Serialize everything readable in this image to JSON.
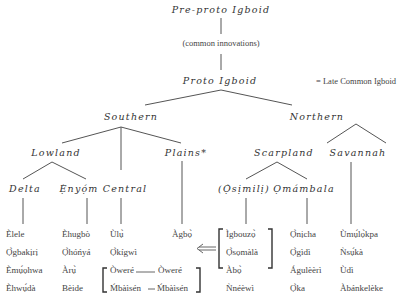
{
  "title_node": "Pre-proto Igboid",
  "innovation_note": "(common innovations)",
  "proto_node": "Proto Igboid",
  "proto_gloss": "= Late Common Igboid",
  "branches": {
    "southern": "Southern",
    "northern": "Northern",
    "lowland": "Lowland",
    "plains": "Plains*",
    "scarpland": "Scarpland",
    "savannah": "Savannah",
    "delta": "Delta",
    "enyom": "Ẹ̀nyọ́m",
    "central": "Central",
    "osimili": "(Ọ̀sịmilị)",
    "omambala": "Ọmámbala"
  },
  "leaves": {
    "delta": [
      "Èlele",
      "Ọ̀gbakịrị",
      "Èmụ́ọhwa",
      "Èhwụ́dà"
    ],
    "enyom": [
      "Èhugbò",
      "Ọ̀hóńyá",
      "Àrụ̀",
      "Bèide"
    ],
    "central": [
      "Ùlụ̀",
      "Ọ̀kígwì"
    ],
    "central_bracket": [
      [
        "Òweré",
        "Òweré"
      ],
      [
        "Ḿbàìsén",
        "Ḿbàìsén"
      ]
    ],
    "plains": [
      "Àgbọ̀"
    ],
    "osimili": [
      "Ìgbouzọ̀",
      "Ọ̀sọmàlà",
      "Àbọ̀",
      "Ǹnéèwì"
    ],
    "omambala": [
      "Ọ̀nịcha",
      "Ọ̀gìdì",
      "Águlèèrì",
      "Ọ̀ka"
    ],
    "savannah": [
      "Ùmụ́lọ̀kpa",
      "Ǹsụ́kà",
      "Ùdì",
      "Àbánkelèke"
    ]
  }
}
